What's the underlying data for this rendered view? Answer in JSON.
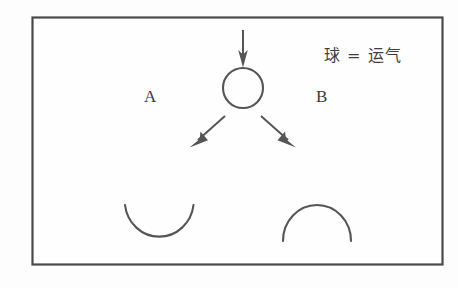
{
  "figure": {
    "title": "",
    "background_color": "#fdfdfd",
    "line_color": "#555555",
    "frame_color": "#4a4a4a"
  },
  "frame": {
    "name": "outer-border"
  },
  "labels": {
    "branch_a": "A",
    "branch_b": "B",
    "legend": "球 = 运气"
  },
  "shapes": {
    "ball": {
      "name": "circle-ball",
      "cx": 243,
      "cy": 88,
      "r": 20
    },
    "cup_left": {
      "name": "cup-arc-open-up",
      "cx": 159,
      "cy": 205,
      "r": 36
    },
    "dome_right": {
      "name": "dome-arc-open-down",
      "cx": 317,
      "cy": 241,
      "r": 34
    }
  },
  "arrows": {
    "down": {
      "name": "arrow-down-into-ball",
      "x1": 243,
      "y1": 30,
      "x2": 243,
      "y2": 66
    },
    "left_diagonal": {
      "name": "arrow-diagonal-left",
      "x1": 224,
      "y1": 117,
      "x2": 191,
      "y2": 146
    },
    "right_diagonal": {
      "name": "arrow-diagonal-right",
      "x1": 262,
      "y1": 117,
      "x2": 294,
      "y2": 146
    }
  }
}
